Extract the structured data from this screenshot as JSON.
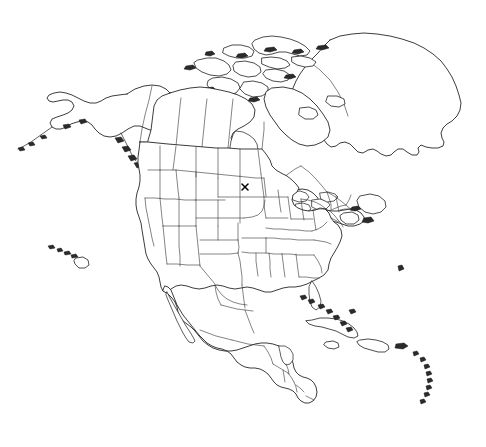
{
  "map": {
    "title": "North America Outline Map",
    "projection": "conic",
    "background_color": "#ffffff",
    "outline_color": "#1a1a1a",
    "border_color": "#333333",
    "width": 486,
    "height": 447,
    "style": "blank outline / reference map, no labels",
    "has_text_labels": false,
    "regions": [
      {
        "name": "alaska",
        "label": "Alaska",
        "kind": "state-outline"
      },
      {
        "name": "canada",
        "label": "Canada",
        "kind": "country-with-provinces"
      },
      {
        "name": "greenland",
        "label": "Greenland",
        "kind": "island-landmass"
      },
      {
        "name": "canadian-arctic-archipelago",
        "label": "Canadian Arctic Archipelago",
        "kind": "island-group"
      },
      {
        "name": "contiguous-united-states",
        "label": "Contiguous United States",
        "kind": "country-with-states"
      },
      {
        "name": "hawaii",
        "label": "Hawaii",
        "kind": "island-group"
      },
      {
        "name": "mexico",
        "label": "Mexico",
        "kind": "country-outline"
      },
      {
        "name": "central-america",
        "label": "Central America",
        "kind": "country-outline"
      },
      {
        "name": "caribbean",
        "label": "Caribbean Islands",
        "kind": "island-group"
      }
    ]
  },
  "markers": [
    {
      "id": "marker-1",
      "glyph": "x",
      "symbol": "✕",
      "color": "#000000",
      "x": 245,
      "y": 187,
      "size": 6,
      "region": "south-dakota",
      "label": ""
    }
  ]
}
